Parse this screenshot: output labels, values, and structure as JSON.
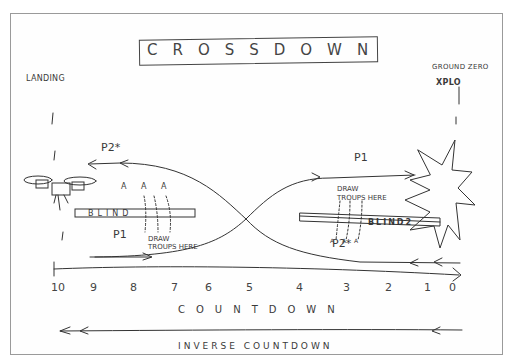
{
  "title": "CROSSDOWN",
  "labels": {
    "landing": "LANDING",
    "ground_zero": "GROUND ZERO",
    "xplo": "XPLO",
    "p1_top": "P1",
    "p2_top": "P2*",
    "p1_bottom": "P1",
    "p2_bottom": "P2*",
    "blind1": "BLIND",
    "blind2": "BLIND2",
    "draw_troops_left": "DRAW TROUPS HERE",
    "draw_troops_right": "DRAW TROUPS HERE",
    "a_marks_left": "A A A",
    "a_marks_right": "A A A",
    "countdown": "COUNTDOWN",
    "inverse_countdown": "INVERSE COUNTDOWN"
  },
  "axis": {
    "ticks": [
      "10",
      "9",
      "8",
      "7",
      "6",
      "5",
      "4",
      "3",
      "2",
      "1",
      "0"
    ]
  },
  "icons": {
    "drone": "drone-icon",
    "explosion": "explosion-icon"
  },
  "colors": {
    "ink": "#333333",
    "frame": "#9a9a9a",
    "paper": "#ffffff"
  }
}
